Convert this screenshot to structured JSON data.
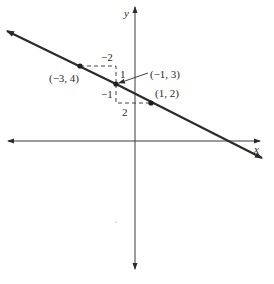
{
  "figure": {
    "axes": {
      "x_label": "x",
      "y_label": "y"
    },
    "line": {
      "description": "line through (-3, 4), (-1, 3), (1, 2) with slope -1/2",
      "color": "#2b2b2b"
    },
    "points": [
      {
        "label": "(−3, 4)",
        "x": -3,
        "y": 4
      },
      {
        "label": "(−1, 3)",
        "x": -1,
        "y": 3
      },
      {
        "label": "(1, 2)",
        "x": 1,
        "y": 2
      }
    ],
    "slope_triangles": [
      {
        "run_label": "−2",
        "rise_label": "1"
      },
      {
        "rise_label": "−1",
        "run_label": "2"
      }
    ]
  }
}
